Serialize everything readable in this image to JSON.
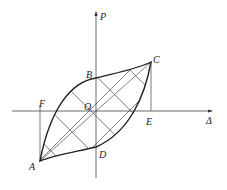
{
  "diagram": {
    "type": "hysteresis loop (load-displacement)",
    "axes": {
      "vertical": "P",
      "horizontal": "Δ"
    },
    "points": {
      "A": "A",
      "B": "B",
      "C": "C",
      "D": "D",
      "E": "E",
      "F": "F",
      "O": "O"
    },
    "fill": "cross-hatched area enclosed by loop",
    "line_color": "#222222"
  }
}
